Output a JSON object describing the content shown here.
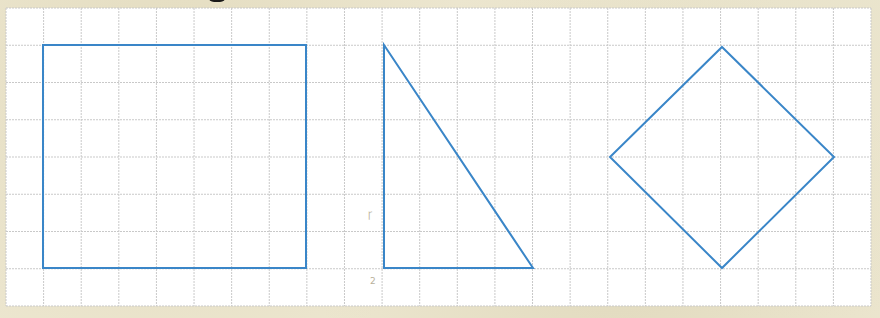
{
  "figure": {
    "title_fragment": "",
    "grid": {
      "left": 6,
      "top": 8,
      "right": 871,
      "bottom": 306,
      "cols": 23,
      "rows": 8,
      "line_color": "#c9c9c9",
      "paper_color": "#ffffff"
    },
    "stroke_color": "#3a86c8",
    "shapes": [
      {
        "name": "rectangle",
        "points": [
          [
            43,
            45
          ],
          [
            306,
            45
          ],
          [
            306,
            268
          ],
          [
            43,
            268
          ]
        ]
      },
      {
        "name": "right-triangle",
        "points": [
          [
            384,
            45
          ],
          [
            533,
            268
          ],
          [
            384,
            268
          ]
        ]
      },
      {
        "name": "square-diamond",
        "points": [
          [
            722,
            47
          ],
          [
            834,
            157
          ],
          [
            722,
            268
          ],
          [
            610,
            157
          ]
        ]
      }
    ],
    "pencil_marks": [
      {
        "text": "Ꞅ",
        "x": 368,
        "y": 218
      },
      {
        "text": "2",
        "x": 370,
        "y": 284
      }
    ]
  }
}
